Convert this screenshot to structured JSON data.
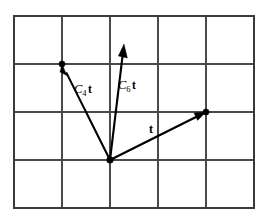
{
  "figure": {
    "background_color": "#ffffff",
    "grid": {
      "columns": 5,
      "rows": 4,
      "cell_size": 48,
      "left": 14,
      "top": 16,
      "right": 254,
      "bottom": 208,
      "line_color": "#4a4a4a",
      "border_color": "#3a3a3a"
    },
    "origin": {
      "x": 110,
      "y": 160,
      "label": "common-tail"
    },
    "vectors": [
      {
        "id": "c4t",
        "label_symbol": "C",
        "label_subscript": "4",
        "label_operand": "t",
        "label_text": "C4t",
        "label_x": 74,
        "label_y": 93,
        "from_x": 110,
        "from_y": 160,
        "to_x": 62,
        "to_y": 64,
        "endpoint_dot": true,
        "color": "#000000"
      },
      {
        "id": "c6t",
        "label_symbol": "C",
        "label_subscript": "6",
        "label_operand": "t",
        "label_text": "C6t",
        "label_x": 118,
        "label_y": 89,
        "from_x": 110,
        "from_y": 160,
        "to_x": 124,
        "to_y": 44,
        "endpoint_dot": false,
        "color": "#000000"
      },
      {
        "id": "t",
        "label_symbol": "",
        "label_subscript": "",
        "label_operand": "t",
        "label_text": "t",
        "label_x": 149,
        "label_y": 133,
        "from_x": 110,
        "from_y": 160,
        "to_x": 206,
        "to_y": 112,
        "endpoint_dot": true,
        "color": "#000000"
      }
    ]
  }
}
